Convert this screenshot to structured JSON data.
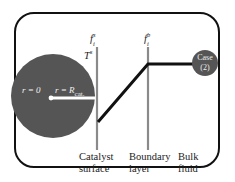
{
  "diagram": {
    "colors": {
      "frame": "#111111",
      "catalyst_particle": "#555555",
      "interface_lines": "#8a8a8a",
      "profile_line": "#111111",
      "case_badge": "#555555",
      "radius_line": "#ffffff"
    },
    "particle": {
      "center_label": "r = 0",
      "surface_label_prefix": "r = R",
      "surface_label_sub": "cat."
    },
    "surface_labels": {
      "fs_base": "f",
      "fs_sup": "s",
      "fs_sub": "i",
      "ts_base": "T",
      "ts_sup": "s",
      "fb_base": "f",
      "fb_sup": "b",
      "fb_sub": "i"
    },
    "case_badge": {
      "line1": "Case",
      "line2": "(2)"
    },
    "region_labels": [
      {
        "line1": "Catalyst",
        "line2": "surface"
      },
      {
        "line1": "Boundary",
        "line2": "layer"
      },
      {
        "line1": "Bulk",
        "line2": "fluid"
      }
    ]
  }
}
